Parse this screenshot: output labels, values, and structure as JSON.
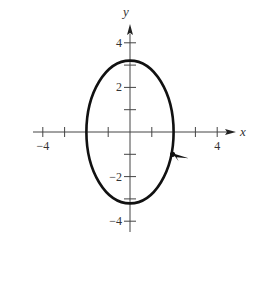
{
  "diagram": {
    "type": "parametric-curve-plot",
    "axes": {
      "x_label": "x",
      "y_label": "y",
      "x_tick_labels": [
        {
          "value": -4,
          "text": "−4"
        },
        {
          "value": 4,
          "text": "4"
        }
      ],
      "y_tick_labels": [
        {
          "value": 4,
          "text": "4"
        },
        {
          "value": 2,
          "text": "2"
        },
        {
          "value": -2,
          "text": "−2"
        },
        {
          "value": -4,
          "text": "−4"
        }
      ],
      "x_ticks": [
        -4,
        -3,
        -2,
        -1,
        1,
        2,
        3,
        4
      ],
      "y_ticks": [
        4,
        3,
        2,
        1,
        -1,
        -2,
        -3,
        -4
      ],
      "xlim": [
        -4.5,
        5
      ],
      "ylim": [
        -4.5,
        5
      ]
    },
    "curve": {
      "shape": "ellipse",
      "center": [
        0,
        0
      ],
      "semi_axis_x": 2,
      "semi_axis_y": 3.2,
      "color": "#111111",
      "orientation_arrow": {
        "at": [
          2,
          -1
        ],
        "direction": "right"
      }
    }
  }
}
